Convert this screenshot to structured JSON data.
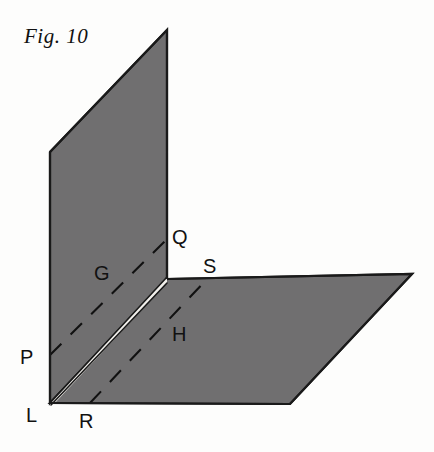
{
  "figure": {
    "caption": "Fig. 10",
    "background_color": "#fdfdfc",
    "plane_fill_color": "#706f70",
    "plane_stroke_color": "#1a1a1a",
    "fold_highlight_color": "#f2f0ec",
    "dash_color": "#111111",
    "label_color": "#111111"
  },
  "labels": {
    "plane_g": "G",
    "plane_h": "H",
    "point_p": "P",
    "point_q": "Q",
    "point_r": "R",
    "point_s": "S",
    "point_l": "L"
  },
  "geometry": {
    "description": "Two shaded planes G (vertical) and H (horizontal) meeting along a fold edge at L; dashed line PQ lies in plane G and dashed line RS lies in plane H.",
    "plane_g_polygon": "167,30 167,279 50,403 50,152",
    "plane_h_polygon": "50,403 167,279 412,274 290,404",
    "fold_edge": "50,403 167,279",
    "dashed_pq": "50,355 166,240",
    "dashed_rs": "90,403 208,278",
    "vertical_right_edge": "167,30 167,279",
    "horizontal_top_edge": "167,279 412,274"
  },
  "points": {
    "p": {
      "x": 50,
      "y": 355
    },
    "q": {
      "x": 166,
      "y": 240
    },
    "r": {
      "x": 90,
      "y": 403
    },
    "s": {
      "x": 208,
      "y": 278
    },
    "l": {
      "x": 50,
      "y": 403
    }
  },
  "label_positions": {
    "caption": {
      "x": 24,
      "y": 24
    },
    "g": {
      "x": 94,
      "y": 262
    },
    "h": {
      "x": 172,
      "y": 323
    },
    "p": {
      "x": 20,
      "y": 346
    },
    "q": {
      "x": 172,
      "y": 226
    },
    "r": {
      "x": 79,
      "y": 410
    },
    "s": {
      "x": 203,
      "y": 255
    },
    "l": {
      "x": 26,
      "y": 404
    }
  }
}
